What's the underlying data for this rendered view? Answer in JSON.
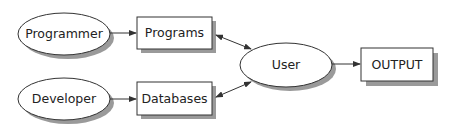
{
  "diagram": {
    "nodes": {
      "programmer": {
        "label": "Programmer",
        "shape": "ellipse"
      },
      "developer": {
        "label": "Developer",
        "shape": "ellipse"
      },
      "programs": {
        "label": "Programs",
        "shape": "rectangle"
      },
      "databases": {
        "label": "Databases",
        "shape": "rectangle"
      },
      "user": {
        "label": "User",
        "shape": "ellipse"
      },
      "output": {
        "label": "OUTPUT",
        "shape": "rectangle"
      }
    },
    "edges": [
      {
        "from": "Programmer",
        "to": "Programs",
        "type": "single-arrow"
      },
      {
        "from": "Developer",
        "to": "Databases",
        "type": "single-arrow"
      },
      {
        "from": "Programs",
        "to": "User",
        "type": "double-arrow"
      },
      {
        "from": "Databases",
        "to": "User",
        "type": "double-arrow"
      },
      {
        "from": "User",
        "to": "OUTPUT",
        "type": "single-arrow"
      }
    ],
    "colors": {
      "stroke": "#333333",
      "shadow": "#9a9a9a",
      "fill": "#ffffff"
    }
  }
}
